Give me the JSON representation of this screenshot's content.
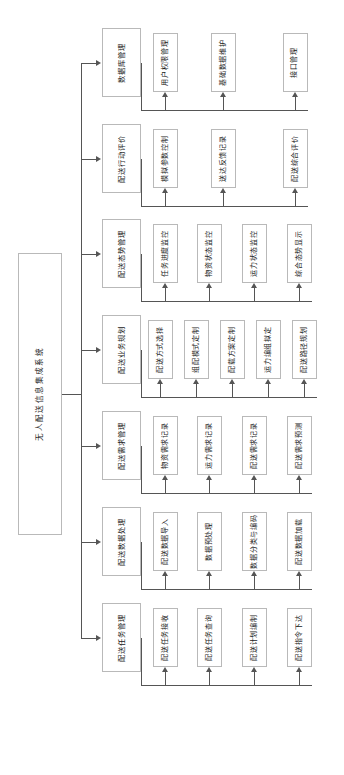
{
  "diagram": {
    "orientation": "rotated-90",
    "root": {
      "label": "无人配送信息集成系统"
    },
    "modules": [
      {
        "label": "数据库管理",
        "children": [
          {
            "label": "用户权限管理"
          },
          {
            "label": "基础数据维护"
          },
          {
            "label": "接口管理"
          }
        ]
      },
      {
        "label": "配送行动评价",
        "children": [
          {
            "label": "模拟参数控制"
          },
          {
            "label": "送达反馈记录"
          },
          {
            "label": "配送综合评价"
          }
        ]
      },
      {
        "label": "配送态势管理",
        "children": [
          {
            "label": "任务进度监控"
          },
          {
            "label": "物资状态监控"
          },
          {
            "label": "运力状态监控"
          },
          {
            "label": "综合态势显示"
          }
        ]
      },
      {
        "label": "配送业务规划",
        "children": [
          {
            "label": "配送方式选择"
          },
          {
            "label": "组配模式定制"
          },
          {
            "label": "配载方案定制"
          },
          {
            "label": "运力编组拟定"
          },
          {
            "label": "配送路径规划"
          }
        ]
      },
      {
        "label": "配送需求管理",
        "children": [
          {
            "label": "物资需求记录"
          },
          {
            "label": "运力需求记录"
          },
          {
            "label": "配送需求记录"
          },
          {
            "label": "配送需求预测"
          }
        ]
      },
      {
        "label": "配送数据处理",
        "children": [
          {
            "label": "配送数据导入"
          },
          {
            "label": "数据预处理"
          },
          {
            "label": "数据分类与编码"
          },
          {
            "label": "配送数据加载"
          }
        ]
      },
      {
        "label": "配送任务管理",
        "children": [
          {
            "label": "配送任务接收"
          },
          {
            "label": "配送任务查询"
          },
          {
            "label": "配送计划编制"
          },
          {
            "label": "配送指令下达"
          }
        ]
      }
    ],
    "colors": {
      "box_border": "#b9b9b9",
      "connector": "#555555",
      "background": "#ffffff",
      "text": "#1a1a1a"
    }
  }
}
